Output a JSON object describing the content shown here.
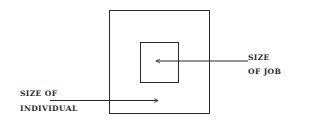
{
  "diagram": {
    "outer_box": {
      "label_line1": "SIZE OF",
      "label_line2": "INDIVIDUAL"
    },
    "inner_box": {
      "label_line1": "SIZE",
      "label_line2": "OF JOB"
    }
  },
  "colors": {
    "stroke": "#2a2a2a",
    "background": "#ffffff"
  }
}
